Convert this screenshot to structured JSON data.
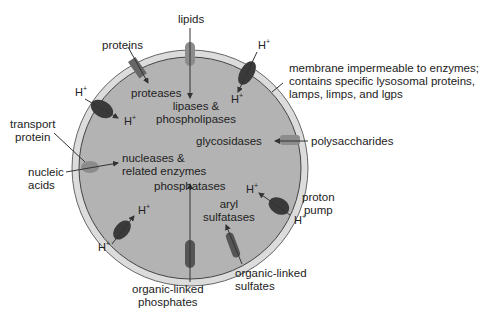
{
  "diagram": {
    "colors": {
      "lumen": "#b3b3b3",
      "membrane": "#dcdcdc",
      "membrane_line": "#555555",
      "pump": "#3a3a3a",
      "channel": "#8c8c8c",
      "text": "#222222"
    },
    "labels": {
      "lipids": "lipids",
      "proteins": "proteins",
      "proteases": "proteases",
      "lipases_1": "lipases &",
      "lipases_2": "phospholipases",
      "membrane_1": "membrane impermeable to enzymes;",
      "membrane_2": "contains specific lysosomal proteins,",
      "membrane_3": "lamps, limps, and lgps",
      "transport_1": "transport",
      "transport_2": "protein",
      "glycosidases": "glycosidases",
      "polysaccharides": "polysaccharides",
      "nucleic_1": "nucleic",
      "nucleic_2": "acids",
      "nucleases_1": "nucleases &",
      "nucleases_2": "related enzymes",
      "phosphatases": "phosphatases",
      "aryl_1": "aryl",
      "aryl_2": "sulfatases",
      "proton_1": "proton",
      "proton_2": "pump",
      "olp_1": "organic-linked",
      "olp_2": "phosphates",
      "ols_1": "organic-linked",
      "ols_2": "sulfates",
      "h": "H",
      "plus": "+"
    }
  }
}
